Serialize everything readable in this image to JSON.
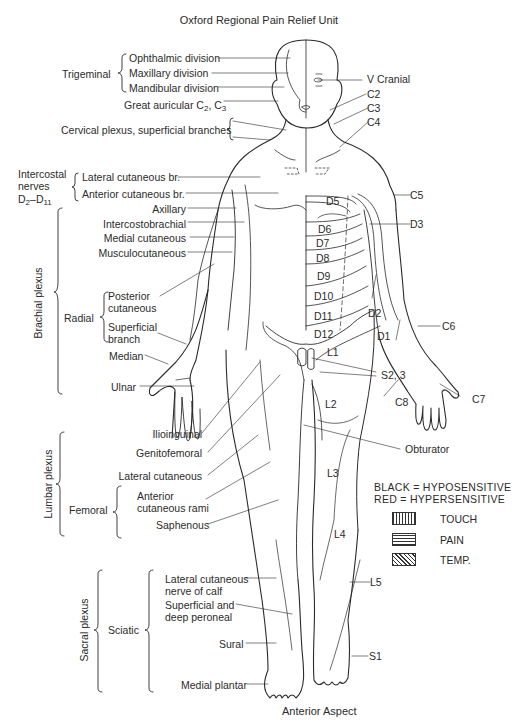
{
  "header": {
    "title": "Oxford Regional Pain Relief Unit"
  },
  "footer": {
    "caption": "Anterior Aspect"
  },
  "left_labels": {
    "trigeminal": {
      "group": "Trigeminal",
      "ophthalmic": "Ophthalmic division",
      "maxillary": "Maxillary division",
      "mandibular": "Mandibular division"
    },
    "great_auricular": {
      "text": "Great auricular C",
      "sub1": "2",
      "sep": ", C",
      "sub2": "3"
    },
    "cervical_plexus": "Cervical plexus, superficial branches",
    "intercostal": {
      "group_line1": "Intercostal",
      "group_line2": "nerves",
      "group_line3_prefix": "D",
      "group_line3_sub1": "2",
      "group_line3_mid": "–D",
      "group_line3_sub2": "11",
      "lateral": "Lateral cutaneous br.",
      "anterior": "Anterior cutaneous br."
    },
    "brachial_plexus": {
      "group": "Brachial plexus",
      "axillary": "Axillary",
      "intercostobrachial": "Intercostobrachial",
      "medial_cutaneous": "Medial cutaneous",
      "musculocutaneous": "Musculocutaneous",
      "radial": {
        "group": "Radial",
        "posterior_1": "Posterior",
        "posterior_2": "cutaneous",
        "superficial_1": "Superficial",
        "superficial_2": "branch"
      },
      "median": "Median",
      "ulnar": "Ulnar"
    },
    "lumbar_plexus": {
      "group": "Lumbar plexus",
      "ilioinguinal": "Ilioinguinal",
      "genitofemoral": "Genitofemoral",
      "lateral_cutaneous": "Lateral cutaneous",
      "femoral": {
        "group": "Femoral",
        "anterior_1": "Anterior",
        "anterior_2": "cutaneous rami",
        "saphenous": "Saphenous"
      }
    },
    "sacral_plexus": {
      "group": "Sacral plexus",
      "sciatic": {
        "group": "Sciatic",
        "lat_calf_1": "Lateral cutaneous",
        "lat_calf_2": "nerve of calf",
        "peroneal_1": "Superficial and",
        "peroneal_2": "deep peroneal",
        "sural": "Sural",
        "medial_plantar": "Medial plantar"
      }
    }
  },
  "right_labels": {
    "v_cranial": "V Cranial",
    "c2": "C2",
    "c3": "C3",
    "c4": "C4",
    "c5": "C5",
    "d3": "D3",
    "d2": "D2",
    "d1": "D1",
    "c6": "C6",
    "s2_3": "S2, 3",
    "c8": "C8",
    "c7": "C7",
    "obturator": "Obturator",
    "l5": "L5",
    "s1": "S1"
  },
  "dermatomes": {
    "d5": "D5",
    "d6": "D6",
    "d7": "D7",
    "d8": "D8",
    "d9": "D9",
    "d10": "D10",
    "d11": "D11",
    "d12": "D12",
    "l1": "L1",
    "l2": "L2",
    "l3": "L3",
    "l4": "L4"
  },
  "legend": {
    "line1": "BLACK = HYPOSENSITIVE",
    "line2": "RED = HYPERSENSITIVE",
    "items": [
      {
        "label": "TOUCH",
        "pattern": "vertical-hatch"
      },
      {
        "label": "PAIN",
        "pattern": "horizontal-hatch"
      },
      {
        "label": "TEMP.",
        "pattern": "diagonal-hatch"
      }
    ]
  },
  "colors": {
    "ink": "#2a2a2a",
    "background": "#ffffff"
  }
}
